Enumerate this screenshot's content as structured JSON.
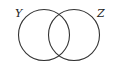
{
  "diagram": {
    "type": "venn",
    "sets": [
      {
        "label": "Y",
        "cx": 44,
        "cy": 35,
        "r": 25.5
      },
      {
        "label": "Z",
        "cx": 74,
        "cy": 35,
        "r": 25.5
      }
    ],
    "stroke_color": "#333333",
    "background": "#ffffff"
  }
}
